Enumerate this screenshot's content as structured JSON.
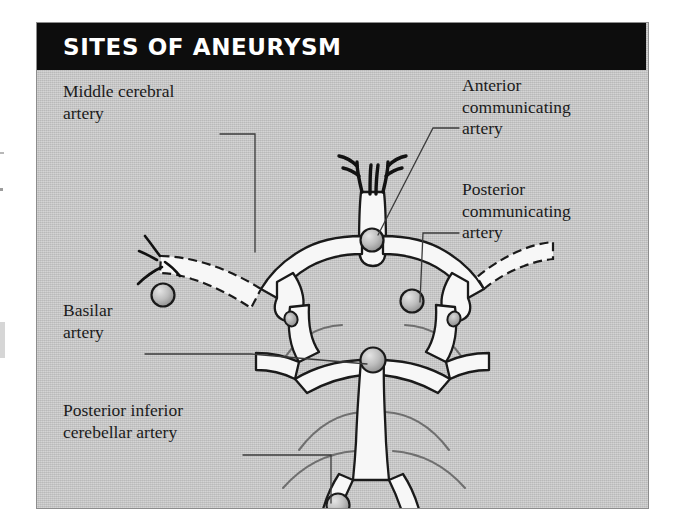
{
  "figure": {
    "title": "SITES OF ANEURYSM",
    "title_bar_color": "#0d0d0d",
    "title_text_color": "#ffffff",
    "panel_background_color": "#c9c9c9",
    "panel_border_color": "#8d8d8d",
    "vessel_fill_color": "#f7f7f7",
    "vessel_outline_color": "#1a1a1a",
    "aneurysm_color": "#b0b0b0",
    "label_text_color": "#1b1b1b",
    "leader_line_color": "#3b3b3b"
  },
  "labels": {
    "middle_cerebral_artery": "Middle cerebral\nartery",
    "anterior_communicating_artery": "Anterior\ncommunicating\nartery",
    "posterior_communicating_artery": "Posterior\ncommunicating\nartery",
    "basilar_artery": "Basilar\nartery",
    "posterior_inferior_cerebellar_artery": "Posterior inferior\ncerebellar artery"
  },
  "aneurysm_sites": [
    {
      "name": "middle-cerebral-artery-aneurysm",
      "label": "Middle cerebral artery",
      "x": 126,
      "y": 225,
      "radius": 11
    },
    {
      "name": "anterior-communicating-artery-aneurysm",
      "label": "Anterior communicating artery",
      "x": 335,
      "y": 170,
      "radius": 11
    },
    {
      "name": "posterior-communicating-artery-aneurysm",
      "label": "Posterior communicating artery",
      "x": 375,
      "y": 230,
      "radius": 11
    },
    {
      "name": "basilar-artery-aneurysm",
      "label": "Basilar artery",
      "x": 336,
      "y": 290,
      "radius": 12
    },
    {
      "name": "posterior-inferior-cerebellar-artery-aneurysm",
      "label": "Posterior inferior cerebellar artery",
      "x": 301,
      "y": 435,
      "radius": 11
    }
  ],
  "vessel_parts": [
    "anterior-cerebral-arteries",
    "anterior-communicating-artery",
    "internal-carotid-artery-stumps",
    "middle-cerebral-artery-left-dashed",
    "middle-cerebral-artery-right-dashed",
    "posterior-communicating-arteries",
    "posterior-cerebral-arteries",
    "superior-cerebellar-arteries",
    "basilar-artery",
    "vertebral-arteries",
    "posterior-inferior-cerebellar-arteries"
  ]
}
